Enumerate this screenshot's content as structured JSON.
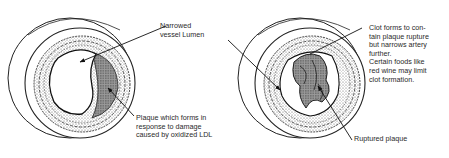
{
  "diagram": {
    "panels": [
      {
        "id": "left-artery",
        "description": "Artery cross-section with plaque narrowing the lumen",
        "labels": {
          "lumen": "Narrowed\nvessel Lumen",
          "plaque": "Plaque which forms in\nresponse to damage\ncaused by oxidized LDL"
        }
      },
      {
        "id": "right-artery",
        "description": "Artery cross-section with ruptured plaque and clot",
        "labels": {
          "clot": "Clot forms to con-\ntain plaque rupture\nbut narrows artery\nfurther.\nCertain foods like\nred wine may limit\nclot formation.",
          "rupture": "Ruptured plaque"
        }
      }
    ],
    "colors": {
      "ink": "#222222",
      "background": "#ffffff",
      "plaque_shade": "#bdbdbd"
    }
  }
}
